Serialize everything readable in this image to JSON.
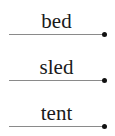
{
  "worksheet": {
    "items": [
      {
        "word": "bed"
      },
      {
        "word": "sled"
      },
      {
        "word": "tent"
      }
    ],
    "colors": {
      "text": "#1a1a1a",
      "line": "#8a8a8a",
      "dot": "#111111"
    }
  }
}
